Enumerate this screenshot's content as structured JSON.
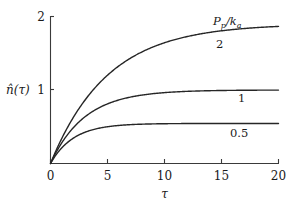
{
  "chart_data": {
    "type": "line",
    "title": "",
    "xlabel": "τ",
    "ylabel": "n̂(τ)",
    "xlim": [
      0,
      20
    ],
    "ylim": [
      0,
      2
    ],
    "xticks": [
      "0",
      "5",
      "10",
      "15",
      "20"
    ],
    "xtick_values": [
      0,
      5,
      10,
      15,
      20
    ],
    "yticks": [
      "1",
      "2"
    ],
    "ytick_values": [
      1,
      2
    ],
    "grid": false,
    "legend_position": "inline-right",
    "legend_title": "P_p/k_a",
    "legend_title_parts": {
      "numerator_base": "P",
      "numerator_sub": "p",
      "denominator_base": "k",
      "denominator_sub": "a"
    },
    "series": [
      {
        "name": "2",
        "label": "2",
        "asymptote": 1.9,
        "time_constant": 5.0,
        "color": "#262626",
        "x": [
          0,
          0.5,
          1,
          1.5,
          2,
          3,
          4,
          5,
          6,
          7,
          8,
          9,
          10,
          11,
          12,
          13,
          14,
          15,
          16,
          17,
          18,
          19,
          20
        ],
        "y": [
          0,
          0.181,
          0.344,
          0.492,
          0.626,
          0.858,
          1.046,
          1.2,
          1.327,
          1.43,
          1.515,
          1.584,
          1.641,
          1.688,
          1.726,
          1.757,
          1.783,
          1.805,
          1.822,
          1.837,
          1.849,
          1.859,
          1.867
        ]
      },
      {
        "name": "1",
        "label": "1",
        "asymptote": 1.0,
        "time_constant": 3.0,
        "color": "#262626",
        "x": [
          0,
          0.5,
          1,
          1.5,
          2,
          3,
          4,
          5,
          6,
          7,
          8,
          9,
          10,
          11,
          12,
          13,
          14,
          15,
          16,
          17,
          18,
          19,
          20
        ],
        "y": [
          0,
          0.154,
          0.283,
          0.393,
          0.487,
          0.632,
          0.736,
          0.811,
          0.865,
          0.901,
          0.936,
          0.95,
          0.964,
          0.974,
          0.982,
          0.987,
          0.991,
          0.993,
          0.995,
          0.997,
          0.998,
          0.999,
          1.0
        ]
      },
      {
        "name": "0.5",
        "label": "0.5",
        "asymptote": 0.545,
        "time_constant": 2.0,
        "color": "#262626",
        "x": [
          0,
          0.5,
          1,
          1.5,
          2,
          3,
          4,
          5,
          6,
          7,
          8,
          9,
          10,
          11,
          12,
          13,
          14,
          15,
          16,
          17,
          18,
          19,
          20
        ],
        "y": [
          0,
          0.12,
          0.215,
          0.288,
          0.345,
          0.423,
          0.471,
          0.5,
          0.518,
          0.529,
          0.535,
          0.539,
          0.541,
          0.543,
          0.544,
          0.544,
          0.545,
          0.545,
          0.545,
          0.545,
          0.545,
          0.545,
          0.545
        ]
      }
    ]
  },
  "axes": {
    "y_tick_top": "2",
    "y_tick_mid": "1",
    "y_label": "n̂(τ)",
    "x_label": "τ",
    "x_tick_0": "0",
    "x_tick_1": "5",
    "x_tick_2": "10",
    "x_tick_3": "15",
    "x_tick_4": "20"
  },
  "curve_labels": {
    "top": "2",
    "middle": "1",
    "bottom": "0.5"
  },
  "colors": {
    "axis": "#3a3a3a",
    "curve": "#262626",
    "background": "#ffffff"
  }
}
